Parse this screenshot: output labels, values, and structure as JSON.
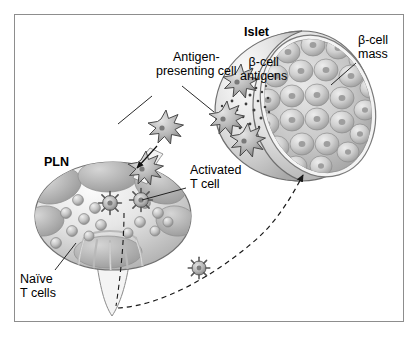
{
  "figure": {
    "domain": "scientific-illustration",
    "background_color": "#ffffff",
    "frame_color": "#8d8d8d",
    "ink_color": "#000000"
  },
  "labels": {
    "antigen_presenting_cell": "Antigen-\npresenting cell",
    "islet": "Islet",
    "beta_cell_antigens": "β-cell\nantigens",
    "beta_cell_mass": "β-cell\nmass",
    "activated_t_cell": "Activated\nT cell",
    "pln": "PLN",
    "naive_t_cells": "Naïve\nT cells"
  },
  "structures": {
    "islet": {
      "name": "Islet",
      "description": "Cut-open ovoid islet of Langerhans; outer capsule shell at left, exposed face at right packed with beta cells",
      "beta_cell_count": 26,
      "fill_light": "#f2f2f2",
      "fill_mid": "#c8c8c8",
      "fill_dark": "#9a9a9a"
    },
    "pln": {
      "name": "Pancreatic lymph node",
      "description": "Ovoid lymph node with dark cortical lobules, pale medullary sinuses and an efferent lymphatic stalk at the bottom",
      "fill_light": "#f0f0f0",
      "fill_mid": "#c4c4c4",
      "fill_dark": "#9d9d9d"
    }
  },
  "cells": {
    "antigen_presenting_cells": {
      "shape": "star",
      "count_in_islet": 3,
      "count_migrating": 2,
      "fill": "#b5b5b5",
      "stroke": "#4a4a4a"
    },
    "activated_t_cells": {
      "shape": "spiked-sphere",
      "count": 3,
      "fill": "#bdbdbd",
      "stroke": "#555555"
    },
    "naive_t_cells": {
      "shape": "sphere",
      "count": 14,
      "fill": "#c9c9c9",
      "stroke": "#8a8a8a"
    },
    "beta_cell_antigens": {
      "shape": "dot",
      "count": 28,
      "fill": "#3c3c3c"
    }
  },
  "flow": {
    "apc_entry_arrow": "Antigen-presenting cell enters the PLN via the afferent lymphatic",
    "t_cell_homing_arrow": "Activated T cell exits the PLN and travels to the islet",
    "arrow_style": "dashed"
  }
}
